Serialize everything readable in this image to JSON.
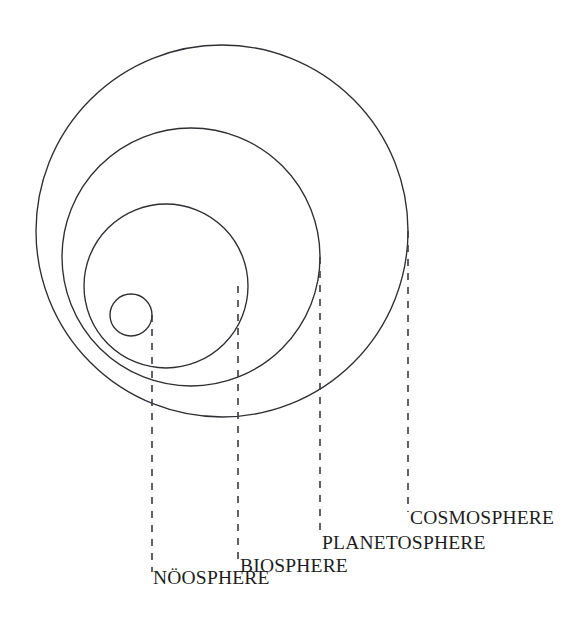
{
  "diagram": {
    "background_color": "#ffffff",
    "stroke_color": "#2e2e33",
    "leader_color": "#3a3a40",
    "text_color": "#1d1d21",
    "canvas": {
      "width": 585,
      "height": 634
    },
    "spheres": [
      {
        "key": "cosmosphere",
        "label": "COSMOSPHERE",
        "order": 1,
        "nesting_level": "outermost",
        "center_x": 222,
        "center_y": 231,
        "radius": 186,
        "leader_x": 408,
        "leader_y_start": 231,
        "leader_y_end": 512,
        "label_x": 410,
        "label_y": 508
      },
      {
        "key": "planetosphere",
        "label": "PLANETOSPHERE",
        "order": 2,
        "nesting_level": "second",
        "center_x": 191,
        "center_y": 257,
        "radius": 129,
        "leader_x": 320,
        "leader_y_start": 257,
        "leader_y_end": 537,
        "label_x": 322,
        "label_y": 533
      },
      {
        "key": "biosphere",
        "label": "BIOSPHERE",
        "order": 3,
        "nesting_level": "third",
        "center_x": 166,
        "center_y": 286,
        "radius": 82,
        "leader_x": 238,
        "leader_y_start": 286,
        "leader_y_end": 560,
        "label_x": 240,
        "label_y": 556
      },
      {
        "key": "noosphere",
        "label": "NÖOSPHERE",
        "order": 4,
        "nesting_level": "innermost",
        "center_x": 131,
        "center_y": 315,
        "radius": 21,
        "leader_x": 152,
        "leader_y_start": 315,
        "leader_y_end": 572,
        "label_x": 153,
        "label_y": 568
      }
    ]
  }
}
